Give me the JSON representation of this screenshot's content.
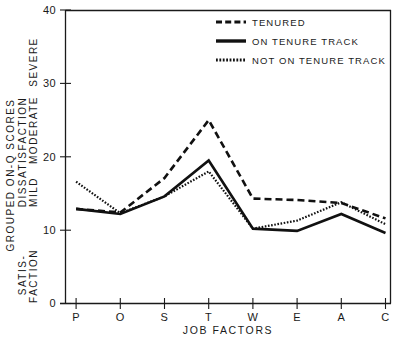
{
  "chart_data": {
    "type": "line",
    "title": "",
    "xlabel": "JOB FACTORS",
    "ylabel": "GROUPED ON-Q SCORES",
    "categories": [
      "P",
      "O",
      "S",
      "T",
      "W",
      "E",
      "A",
      "C"
    ],
    "x_tick_labels": [
      "P",
      "O",
      "S",
      "T",
      "W",
      "E",
      "A",
      "C"
    ],
    "y_tick_labels": [
      "0",
      "10",
      "20",
      "30",
      "40"
    ],
    "y_ticks": [
      0,
      10,
      20,
      30,
      40
    ],
    "ylim": [
      0,
      40
    ],
    "xlim": [
      0,
      9
    ],
    "grid": false,
    "legend_position": "top-right",
    "y_zone_labels": [
      {
        "text": "SEVERE",
        "value": 34
      },
      {
        "text": "MODERATE",
        "value": 26
      },
      {
        "text": "MILD",
        "value": 17
      },
      {
        "text": "SATIS-",
        "value": 6
      },
      {
        "text": "FACTION",
        "value": 4
      }
    ],
    "y_band_label": "DISSATISFACTION",
    "series": [
      {
        "name": "TENURED",
        "style": "dashed",
        "color": "#111111",
        "values": [
          12.9,
          12.4,
          17.1,
          25.0,
          14.3,
          14.1,
          13.7,
          11.6
        ]
      },
      {
        "name": "ON TENURE TRACK",
        "style": "solid",
        "color": "#111111",
        "values": [
          12.9,
          12.2,
          14.6,
          19.5,
          10.2,
          9.9,
          12.2,
          9.6
        ]
      },
      {
        "name": "NOT ON TENURE TRACK",
        "style": "dotted",
        "color": "#111111",
        "values": [
          16.6,
          12.3,
          14.6,
          18.0,
          10.2,
          11.3,
          13.8,
          10.8
        ]
      }
    ]
  },
  "legend": {
    "entries": [
      {
        "label": "TENURED",
        "swatch": "dashed-line-swatch"
      },
      {
        "label": "ON TENURE TRACK",
        "swatch": "solid-line-swatch"
      },
      {
        "label": "NOT ON TENURE TRACK",
        "swatch": "dotted-line-swatch"
      }
    ]
  }
}
